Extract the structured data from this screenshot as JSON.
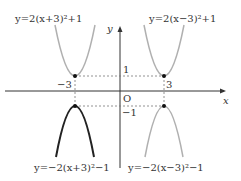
{
  "diagram": {
    "axes": {
      "x_label": "x",
      "y_label": "y",
      "origin_label": "O"
    },
    "ticks": {
      "x_neg": "−3",
      "x_pos": "3",
      "y_pos": "1",
      "y_neg": "−1"
    },
    "curves": [
      {
        "id": "top-left",
        "label": "y=2(x+3)²+1",
        "vertex": [
          -3,
          1
        ],
        "opens": "up",
        "color": "#b0b0b0"
      },
      {
        "id": "top-right",
        "label": "y=2(x−3)²+1",
        "vertex": [
          3,
          1
        ],
        "opens": "up",
        "color": "#b0b0b0"
      },
      {
        "id": "bottom-left",
        "label": "y=−2(x+3)²−1",
        "vertex": [
          -3,
          -1
        ],
        "opens": "down",
        "color": "#222222"
      },
      {
        "id": "bottom-right",
        "label": "y=−2(x−3)²−1",
        "vertex": [
          3,
          -1
        ],
        "opens": "down",
        "color": "#b0b0b0"
      }
    ]
  }
}
